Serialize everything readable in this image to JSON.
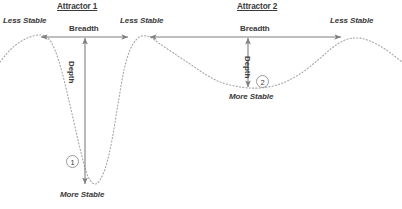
{
  "figure": {
    "title": "",
    "background_color": "#ffffff",
    "curve_color": "#a8a8a8",
    "arrow_color": "#7f7f7f",
    "text_color": "#3a3a3a",
    "width": 402,
    "height": 209
  },
  "attractors": [
    {
      "id": "attractor-1",
      "title": "Attractor 1",
      "title_x": 57,
      "title_y": 3,
      "breadth_label": "Breadth",
      "breadth_label_x": 69,
      "breadth_label_y": 25,
      "depth_label": "Depth",
      "depth_label_x": 75,
      "depth_label_y": 61,
      "more_stable_label": "More Stable",
      "more_stable_x": 60,
      "more_stable_y": 191,
      "node_number": "1",
      "node_x": 66,
      "node_y": 155,
      "breadth_arrow": {
        "x1": 41,
        "x2": 128,
        "y": 37
      },
      "depth_arrow": {
        "x": 85,
        "y1": 38,
        "y2": 184
      }
    },
    {
      "id": "attractor-2",
      "title": "Attractor 2",
      "title_x": 237,
      "title_y": 3,
      "breadth_label": "Breadth",
      "breadth_label_x": 240,
      "breadth_label_y": 25,
      "depth_label": "Depth",
      "depth_label_x": 251,
      "depth_label_y": 56,
      "more_stable_label": "More Stable",
      "more_stable_x": 229,
      "more_stable_y": 93,
      "node_number": "2",
      "node_x": 256,
      "node_y": 75,
      "breadth_arrow": {
        "x1": 150,
        "x2": 341,
        "y": 37
      },
      "depth_arrow": {
        "x": 248,
        "y1": 38,
        "y2": 87
      }
    }
  ],
  "peak_labels": [
    {
      "text": "Less Stable",
      "x": 3,
      "y": 17
    },
    {
      "text": "Less Stable",
      "x": 120,
      "y": 17
    },
    {
      "text": "Less Stable",
      "x": 330,
      "y": 17
    }
  ],
  "chart_data": {
    "type": "line",
    "xlabel": "",
    "ylabel": "Stability (down = more stable)",
    "legend": [],
    "grid": false,
    "xlim": [
      0,
      402
    ],
    "ylim": [
      0,
      209
    ],
    "series": [
      {
        "name": "potential-landscape",
        "style": "dotted",
        "color": "#a8a8a8",
        "points": [
          [
            0,
            62
          ],
          [
            10,
            50
          ],
          [
            20,
            42
          ],
          [
            30,
            37
          ],
          [
            40,
            35
          ],
          [
            48,
            38
          ],
          [
            55,
            50
          ],
          [
            62,
            72
          ],
          [
            70,
            105
          ],
          [
            78,
            140
          ],
          [
            85,
            168
          ],
          [
            90,
            180
          ],
          [
            95,
            184
          ],
          [
            100,
            180
          ],
          [
            106,
            166
          ],
          [
            112,
            140
          ],
          [
            118,
            104
          ],
          [
            124,
            70
          ],
          [
            130,
            50
          ],
          [
            136,
            40
          ],
          [
            142,
            36
          ],
          [
            150,
            37
          ],
          [
            160,
            44
          ],
          [
            175,
            54
          ],
          [
            190,
            64
          ],
          [
            205,
            74
          ],
          [
            220,
            82
          ],
          [
            240,
            87
          ],
          [
            260,
            88
          ],
          [
            280,
            84
          ],
          [
            300,
            74
          ],
          [
            318,
            60
          ],
          [
            332,
            48
          ],
          [
            345,
            40
          ],
          [
            358,
            38
          ],
          [
            370,
            41
          ],
          [
            385,
            49
          ],
          [
            402,
            62
          ]
        ]
      }
    ],
    "annotations": [
      {
        "label": "Less Stable",
        "role": "peak",
        "x": 30,
        "y": 35
      },
      {
        "label": "Less Stable",
        "role": "peak",
        "x": 142,
        "y": 36
      },
      {
        "label": "Less Stable",
        "role": "peak",
        "x": 358,
        "y": 38
      },
      {
        "label": "More Stable",
        "role": "trough",
        "x": 95,
        "y": 184
      },
      {
        "label": "More Stable",
        "role": "trough",
        "x": 262,
        "y": 88
      },
      {
        "label": "Breadth",
        "role": "horizontal-span",
        "from_x": 41,
        "to_x": 128,
        "y": 37
      },
      {
        "label": "Breadth",
        "role": "horizontal-span",
        "from_x": 150,
        "to_x": 341,
        "y": 37
      },
      {
        "label": "Depth",
        "role": "vertical-span",
        "x": 85,
        "from_y": 38,
        "to_y": 184
      },
      {
        "label": "Depth",
        "role": "vertical-span",
        "x": 248,
        "from_y": 38,
        "to_y": 87
      },
      {
        "label": "1",
        "role": "node-marker",
        "x": 73,
        "y": 161
      },
      {
        "label": "2",
        "role": "node-marker",
        "x": 262,
        "y": 81
      }
    ]
  }
}
